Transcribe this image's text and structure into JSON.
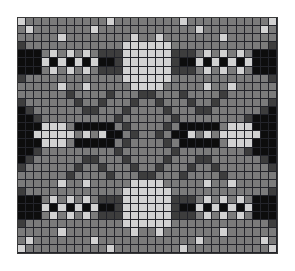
{
  "document": {
    "title": "Colorwork Chart",
    "kind": "knitting-colorwork-chart",
    "description": "Symmetric four-shade grid motif chart"
  },
  "chart_data": {
    "type": "heatmap",
    "xlabel": "",
    "ylabel": "",
    "columns": 32,
    "rows": 29,
    "grid": true,
    "legend": {
      "position": "none",
      "entries": [
        {
          "key": "0",
          "label": "Black",
          "color": "#0d0d0d"
        },
        {
          "key": "1",
          "label": "Dark Gray",
          "color": "#3d3d3d"
        },
        {
          "key": "2",
          "label": "Medium Gray",
          "color": "#7b7b7b"
        },
        {
          "key": "3",
          "label": "Light Gray",
          "color": "#d2d2d2"
        }
      ]
    },
    "palette": [
      "#0d0d0d",
      "#3d3d3d",
      "#7b7b7b",
      "#d2d2d2"
    ],
    "cell_size": 8.1,
    "values": [
      [
        3,
        2,
        2,
        2,
        2,
        2,
        2,
        2,
        2,
        2,
        2,
        3,
        2,
        2,
        2,
        2,
        2,
        2,
        2,
        2,
        3,
        2,
        2,
        2,
        2,
        2,
        2,
        2,
        2,
        2,
        2,
        3
      ],
      [
        2,
        3,
        2,
        2,
        2,
        2,
        2,
        2,
        2,
        3,
        2,
        2,
        2,
        2,
        2,
        2,
        2,
        2,
        2,
        2,
        2,
        2,
        3,
        2,
        2,
        2,
        2,
        2,
        2,
        2,
        3,
        2
      ],
      [
        2,
        2,
        2,
        2,
        2,
        3,
        2,
        2,
        2,
        2,
        2,
        2,
        2,
        2,
        3,
        2,
        2,
        3,
        2,
        2,
        2,
        2,
        2,
        2,
        2,
        3,
        2,
        2,
        2,
        2,
        2,
        2
      ],
      [
        1,
        2,
        2,
        2,
        2,
        2,
        2,
        2,
        2,
        2,
        2,
        2,
        2,
        3,
        3,
        3,
        3,
        3,
        3,
        2,
        2,
        2,
        2,
        2,
        2,
        2,
        2,
        2,
        2,
        2,
        2,
        1
      ],
      [
        0,
        0,
        0,
        2,
        3,
        2,
        3,
        2,
        3,
        2,
        1,
        1,
        1,
        3,
        3,
        3,
        3,
        3,
        3,
        1,
        1,
        1,
        2,
        3,
        2,
        3,
        2,
        3,
        2,
        0,
        0,
        0
      ],
      [
        0,
        0,
        0,
        3,
        0,
        3,
        0,
        3,
        0,
        3,
        0,
        0,
        1,
        3,
        3,
        3,
        3,
        3,
        3,
        1,
        0,
        0,
        3,
        0,
        3,
        0,
        3,
        0,
        3,
        0,
        0,
        0
      ],
      [
        0,
        0,
        0,
        2,
        3,
        2,
        3,
        2,
        3,
        2,
        1,
        1,
        1,
        3,
        3,
        3,
        3,
        3,
        3,
        1,
        1,
        1,
        2,
        3,
        2,
        3,
        2,
        3,
        2,
        0,
        0,
        0
      ],
      [
        1,
        2,
        2,
        2,
        2,
        2,
        2,
        2,
        2,
        2,
        2,
        2,
        2,
        3,
        3,
        3,
        3,
        3,
        3,
        2,
        2,
        2,
        2,
        2,
        2,
        2,
        2,
        2,
        2,
        2,
        2,
        1
      ],
      [
        2,
        2,
        2,
        2,
        2,
        3,
        2,
        2,
        3,
        2,
        2,
        2,
        2,
        2,
        3,
        3,
        3,
        3,
        2,
        2,
        2,
        2,
        2,
        3,
        2,
        2,
        3,
        2,
        2,
        2,
        2,
        2
      ],
      [
        2,
        2,
        2,
        2,
        2,
        2,
        1,
        2,
        2,
        2,
        2,
        1,
        2,
        2,
        2,
        1,
        1,
        2,
        2,
        2,
        1,
        2,
        2,
        2,
        2,
        1,
        2,
        2,
        2,
        2,
        2,
        2
      ],
      [
        1,
        2,
        2,
        2,
        2,
        2,
        2,
        1,
        2,
        2,
        1,
        2,
        2,
        2,
        1,
        2,
        2,
        1,
        2,
        2,
        2,
        1,
        2,
        2,
        1,
        2,
        2,
        2,
        2,
        2,
        2,
        1
      ],
      [
        0,
        1,
        2,
        2,
        2,
        2,
        2,
        2,
        1,
        1,
        2,
        2,
        2,
        1,
        2,
        2,
        2,
        2,
        1,
        2,
        2,
        2,
        1,
        1,
        2,
        2,
        2,
        2,
        2,
        2,
        1,
        0
      ],
      [
        0,
        0,
        1,
        2,
        2,
        2,
        2,
        2,
        2,
        2,
        2,
        2,
        1,
        2,
        2,
        2,
        2,
        2,
        2,
        1,
        2,
        2,
        2,
        2,
        2,
        2,
        2,
        2,
        1,
        0,
        0,
        0
      ],
      [
        0,
        0,
        0,
        3,
        3,
        3,
        2,
        0,
        0,
        0,
        0,
        0,
        2,
        1,
        2,
        2,
        2,
        2,
        1,
        2,
        0,
        0,
        0,
        0,
        0,
        2,
        3,
        3,
        3,
        0,
        0,
        0
      ],
      [
        0,
        0,
        3,
        3,
        3,
        3,
        3,
        2,
        3,
        2,
        3,
        0,
        0,
        2,
        1,
        2,
        2,
        1,
        2,
        0,
        0,
        3,
        2,
        3,
        2,
        3,
        3,
        3,
        3,
        3,
        0,
        0
      ],
      [
        0,
        0,
        0,
        3,
        3,
        3,
        2,
        0,
        0,
        0,
        0,
        0,
        2,
        1,
        2,
        2,
        2,
        2,
        1,
        2,
        0,
        0,
        0,
        0,
        0,
        2,
        3,
        3,
        3,
        0,
        0,
        0
      ],
      [
        0,
        0,
        1,
        2,
        2,
        2,
        2,
        2,
        2,
        2,
        2,
        2,
        1,
        2,
        2,
        2,
        2,
        2,
        2,
        1,
        2,
        2,
        2,
        2,
        2,
        2,
        2,
        2,
        1,
        0,
        0,
        0
      ],
      [
        0,
        1,
        2,
        2,
        2,
        2,
        2,
        2,
        1,
        1,
        2,
        2,
        2,
        1,
        2,
        2,
        2,
        2,
        1,
        2,
        2,
        2,
        1,
        1,
        2,
        2,
        2,
        2,
        2,
        2,
        1,
        0
      ],
      [
        1,
        2,
        2,
        2,
        2,
        2,
        2,
        1,
        2,
        2,
        1,
        2,
        2,
        2,
        1,
        2,
        2,
        1,
        2,
        2,
        2,
        1,
        2,
        2,
        1,
        2,
        2,
        2,
        2,
        2,
        2,
        1
      ],
      [
        2,
        2,
        2,
        2,
        2,
        2,
        1,
        2,
        2,
        2,
        2,
        1,
        2,
        2,
        2,
        1,
        1,
        2,
        2,
        2,
        1,
        2,
        2,
        2,
        2,
        1,
        2,
        2,
        2,
        2,
        2,
        2
      ],
      [
        2,
        2,
        2,
        2,
        2,
        3,
        2,
        2,
        3,
        2,
        2,
        2,
        2,
        2,
        3,
        3,
        3,
        3,
        2,
        2,
        2,
        2,
        2,
        3,
        2,
        2,
        3,
        2,
        2,
        2,
        2,
        2
      ],
      [
        1,
        2,
        2,
        2,
        2,
        2,
        2,
        2,
        2,
        2,
        2,
        2,
        2,
        3,
        3,
        3,
        3,
        3,
        3,
        2,
        2,
        2,
        2,
        2,
        2,
        2,
        2,
        2,
        2,
        2,
        2,
        1
      ],
      [
        0,
        0,
        0,
        2,
        3,
        2,
        3,
        2,
        3,
        2,
        1,
        1,
        1,
        3,
        3,
        3,
        3,
        3,
        3,
        1,
        1,
        1,
        2,
        3,
        2,
        3,
        2,
        3,
        2,
        0,
        0,
        0
      ],
      [
        0,
        0,
        0,
        3,
        0,
        3,
        0,
        3,
        0,
        3,
        0,
        0,
        1,
        3,
        3,
        3,
        3,
        3,
        3,
        1,
        0,
        0,
        3,
        0,
        3,
        0,
        3,
        0,
        3,
        0,
        0,
        0
      ],
      [
        0,
        0,
        0,
        2,
        3,
        2,
        3,
        2,
        3,
        2,
        1,
        1,
        1,
        3,
        3,
        3,
        3,
        3,
        3,
        1,
        1,
        1,
        2,
        3,
        2,
        3,
        2,
        3,
        2,
        0,
        0,
        0
      ],
      [
        1,
        2,
        2,
        2,
        2,
        2,
        2,
        2,
        2,
        2,
        2,
        2,
        2,
        3,
        3,
        3,
        3,
        3,
        3,
        2,
        2,
        2,
        2,
        2,
        2,
        2,
        2,
        2,
        2,
        2,
        2,
        1
      ],
      [
        2,
        2,
        2,
        2,
        2,
        3,
        2,
        2,
        2,
        2,
        2,
        2,
        2,
        2,
        3,
        2,
        2,
        3,
        2,
        2,
        2,
        2,
        2,
        2,
        2,
        3,
        2,
        2,
        2,
        2,
        2,
        2
      ],
      [
        2,
        3,
        2,
        2,
        2,
        2,
        2,
        2,
        2,
        3,
        2,
        2,
        2,
        2,
        2,
        2,
        2,
        2,
        2,
        2,
        2,
        2,
        3,
        2,
        2,
        2,
        2,
        2,
        2,
        2,
        3,
        2
      ],
      [
        3,
        2,
        2,
        2,
        2,
        2,
        2,
        2,
        2,
        2,
        2,
        3,
        2,
        2,
        2,
        2,
        2,
        2,
        2,
        2,
        3,
        2,
        2,
        2,
        2,
        2,
        2,
        2,
        2,
        2,
        2,
        3
      ]
    ]
  }
}
